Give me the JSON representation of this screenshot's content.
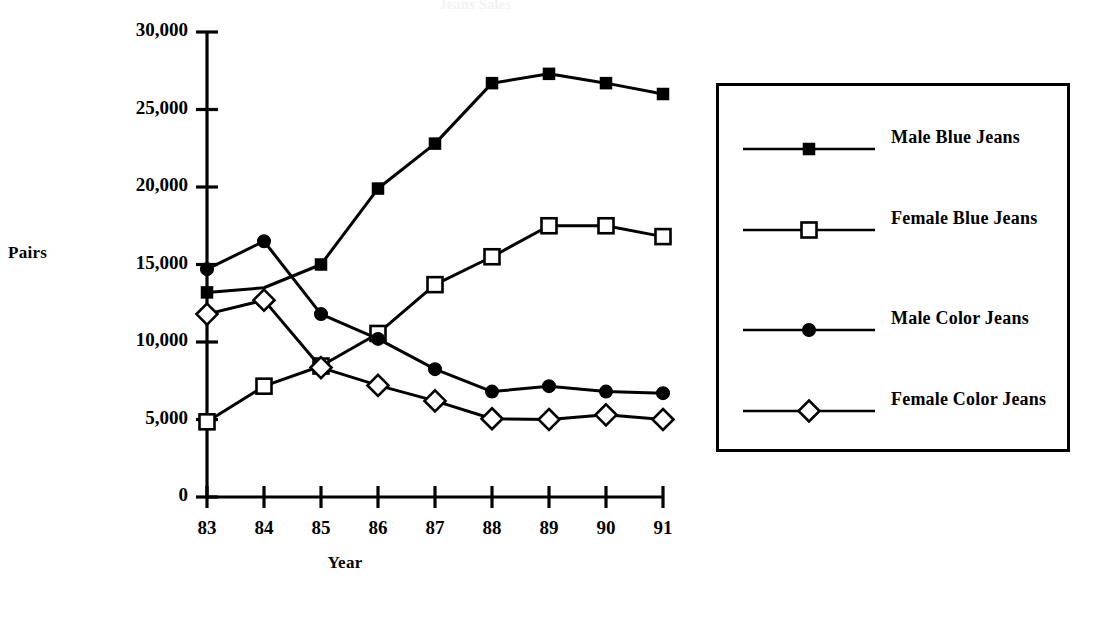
{
  "chart_data": {
    "type": "line",
    "title": "Jeans Sales",
    "xlabel": "Year",
    "ylabel": "Pairs",
    "categories": [
      "83",
      "84",
      "85",
      "86",
      "87",
      "88",
      "89",
      "90",
      "91"
    ],
    "x": [
      83,
      84,
      85,
      86,
      87,
      88,
      89,
      90,
      91
    ],
    "ylim": [
      0,
      30000
    ],
    "xlim": [
      83,
      91
    ],
    "yticks": [
      0,
      5000,
      10000,
      15000,
      20000,
      25000,
      30000
    ],
    "ytick_labels": [
      "0",
      "5,000",
      "10,000",
      "15,000",
      "20,000",
      "25,000",
      "30,000"
    ],
    "grid": false,
    "legend_position": "right",
    "series": [
      {
        "name": "Male Blue Jeans",
        "marker": "filled-square",
        "values": [
          13200,
          13500,
          15000,
          19900,
          22800,
          26700,
          27300,
          26700,
          26000
        ]
      },
      {
        "name": "Female Blue Jeans",
        "marker": "open-square",
        "values": [
          4850,
          7150,
          8450,
          10550,
          13700,
          15500,
          17500,
          17500,
          16800
        ]
      },
      {
        "name": "Male Color Jeans",
        "marker": "filled-circle",
        "values": [
          14700,
          16500,
          11800,
          10200,
          8250,
          6800,
          7150,
          6800,
          6700
        ]
      },
      {
        "name": "Female Color Jeans",
        "marker": "open-diamond",
        "values": [
          11800,
          12700,
          8350,
          7200,
          6200,
          5050,
          5000,
          5300,
          5000
        ]
      }
    ]
  },
  "legend": {
    "entries": [
      {
        "label": "Male Blue Jeans",
        "marker": "filled-square"
      },
      {
        "label": "Female Blue Jeans",
        "marker": "open-square"
      },
      {
        "label": "Male Color Jeans",
        "marker": "filled-circle"
      },
      {
        "label": "Female Color Jeans",
        "marker": "open-diamond"
      }
    ]
  },
  "colors": {
    "ink": "#000000",
    "background": "#ffffff"
  }
}
